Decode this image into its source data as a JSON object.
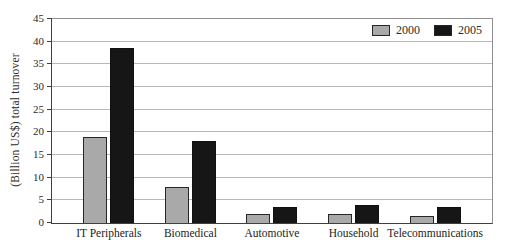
{
  "figure": {
    "background_color": "#ffffff"
  },
  "chart_data": {
    "type": "bar",
    "title": "",
    "xlabel": "",
    "ylabel": "(Billion US$) total turnover",
    "categories": [
      "IT Peripherals",
      "Biomedical",
      "Automotive",
      "Household",
      "Telecommunications"
    ],
    "series": [
      {
        "name": "2000",
        "color": "#a9a9a9",
        "values": [
          19,
          8,
          2,
          2,
          1.5
        ]
      },
      {
        "name": "2005",
        "color": "#161616",
        "values": [
          38.5,
          18,
          3.5,
          4,
          3.5
        ]
      }
    ],
    "ylim": [
      0,
      45
    ],
    "yticks": [
      0,
      5,
      10,
      15,
      20,
      25,
      30,
      35,
      40,
      45
    ],
    "grid": "horizontal",
    "legend_position": "top-right-inside"
  },
  "colors": {
    "gridline": "#b8b8b8",
    "axis": "#3f3f3f",
    "frame": "#8f8f8f",
    "text": "#222222",
    "bar_2000_fill": "#a9a9a9",
    "bar_2000_border": "#262626",
    "bar_2005_fill": "#161616"
  }
}
